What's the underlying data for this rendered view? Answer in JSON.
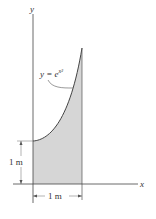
{
  "diagram": {
    "axes": {
      "x_label": "x",
      "y_label": "y"
    },
    "curve": {
      "equation_lhs": "y = e",
      "equation_exp": "x²",
      "fill_color": "#d9d9d9",
      "line_color": "#333333"
    },
    "dimensions": {
      "vertical": "1 m",
      "horizontal": "1 m"
    }
  }
}
